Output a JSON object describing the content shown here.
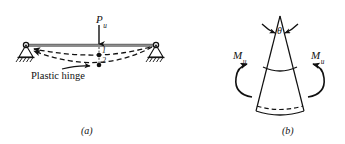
{
  "figure": {
    "background_color": "#ffffff",
    "line_color": "#111111",
    "beam_color": "#8c8c8c",
    "width": 345,
    "height": 144,
    "panel_a": {
      "caption": "(a)",
      "load_label": {
        "symbol": "P",
        "subscript": "u",
        "full": "Pu"
      },
      "plastic_hinge_label": "Plastic hinge",
      "hinge_point_labels": [
        "1",
        "2"
      ],
      "support_type_left": "pin-hatched",
      "support_type_right": "pin-hatched",
      "deflection_curves": 2,
      "description": "Simply supported beam with ultimate point load at midspan and two dashed deflected shapes"
    },
    "panel_b": {
      "caption": "(b)",
      "angle_label": "θ",
      "moment_label_left": {
        "symbol": "M",
        "subscript": "u",
        "full": "Mu"
      },
      "moment_label_right": {
        "symbol": "M",
        "subscript": "u",
        "full": "Mu"
      },
      "description": "Wedge-shaped plastic hinge rotation element with rotation angle theta and end moments Mu"
    }
  }
}
